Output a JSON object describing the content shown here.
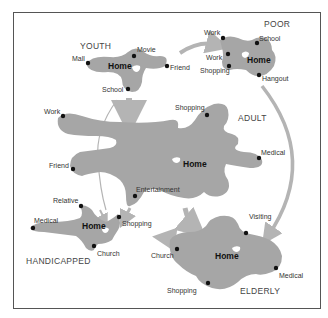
{
  "diagram": {
    "colors": {
      "blob": "#a6a6a6",
      "arrow": "#b4b4b4",
      "dot": "#111111",
      "frame": "#555555"
    },
    "groups": [
      {
        "name": "YOUTH",
        "home": "Home",
        "destinations": [
          "Mall",
          "Movie",
          "Friend",
          "School"
        ]
      },
      {
        "name": "POOR",
        "home": "Home",
        "destinations": [
          "Work",
          "School",
          "Work",
          "Shopping",
          "Hangout"
        ]
      },
      {
        "name": "ADULT",
        "home": "Home",
        "destinations": [
          "Work",
          "Shopping",
          "Medical",
          "Friend",
          "Entertainment"
        ]
      },
      {
        "name": "HANDICAPPED",
        "home": "Home",
        "destinations": [
          "Relative",
          "Medical",
          "Shopping",
          "Church"
        ]
      },
      {
        "name": "ELDERLY",
        "home": "Home",
        "destinations": [
          "Visiting",
          "Church",
          "Medical",
          "Shopping"
        ]
      }
    ],
    "transitions": [
      {
        "from": "YOUTH",
        "to": "ADULT"
      },
      {
        "from": "YOUTH",
        "to": "POOR"
      },
      {
        "from": "POOR",
        "to": "ELDERLY"
      },
      {
        "from": "ADULT",
        "to": "ELDERLY"
      },
      {
        "from": "ADULT",
        "to": "HANDICAPPED"
      },
      {
        "from": "YOUTH",
        "to": "HANDICAPPED"
      },
      {
        "from": "ELDERLY",
        "to": "HANDICAPPED"
      }
    ]
  }
}
